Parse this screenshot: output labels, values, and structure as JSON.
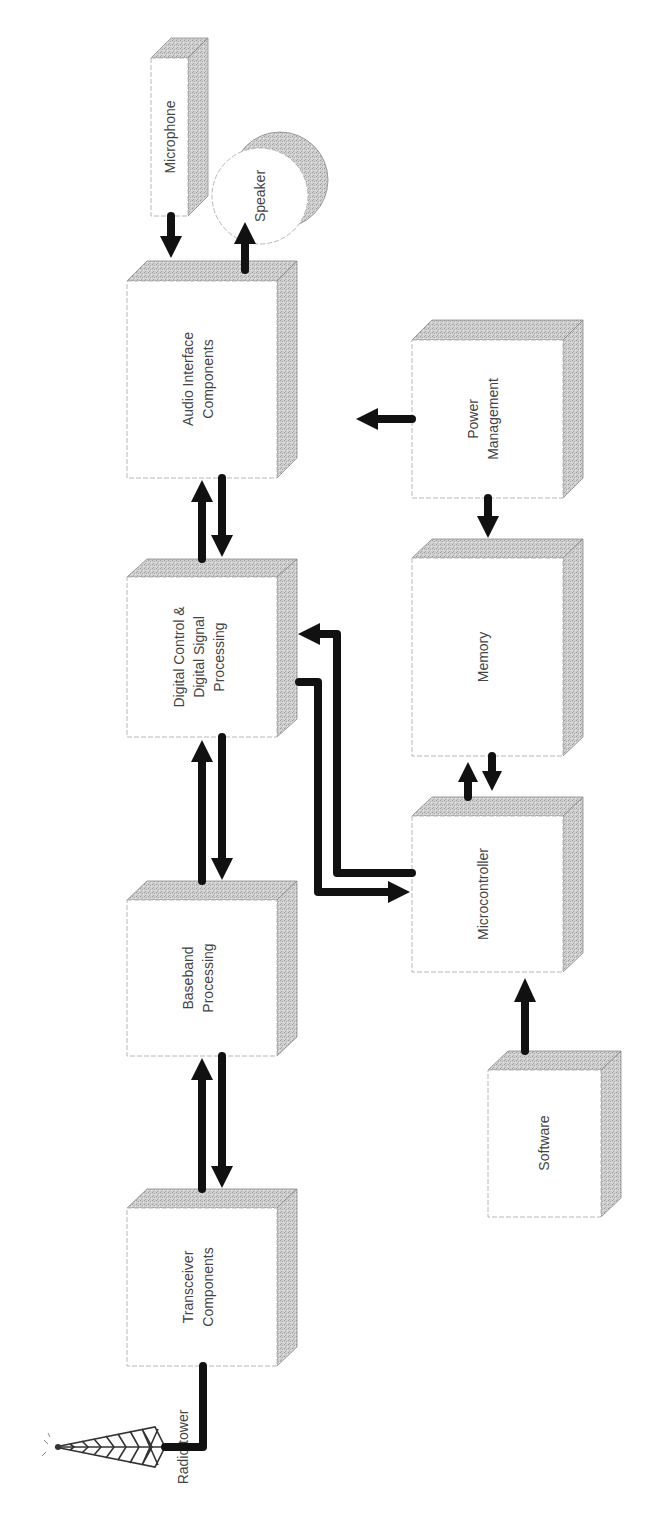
{
  "diagram": {
    "title": "",
    "orientation": "rotated-90-ccw",
    "colors": {
      "block_face": "#ffffff",
      "block_depth": "#c8c8c8",
      "arrow": "#111111",
      "text": "#444444"
    },
    "blocks": {
      "microphone": {
        "label": "Microphone"
      },
      "speaker": {
        "label": "Speaker"
      },
      "audio": {
        "line1": "Audio Interface",
        "line2": "Components"
      },
      "dsp": {
        "line1": "Digital Control &",
        "line2": "Digital Signal",
        "line3": "Processing"
      },
      "baseband": {
        "line1": "Baseband",
        "line2": "Processing"
      },
      "transceiver": {
        "line1": "Transceiver",
        "line2": "Components"
      },
      "power": {
        "line1": "Power",
        "line2": "Management"
      },
      "memory": {
        "label": "Memory"
      },
      "microcontroller": {
        "label": "Microcontroller"
      },
      "software": {
        "label": "Software"
      },
      "tower": {
        "label": "Radio tower"
      }
    },
    "connections": [
      {
        "from": "Microphone",
        "to": "Audio Interface Components",
        "direction": "one-way"
      },
      {
        "from": "Audio Interface Components",
        "to": "Speaker",
        "direction": "one-way"
      },
      {
        "from": "Audio Interface Components",
        "to": "Digital Control & Digital Signal Processing",
        "direction": "bidirectional"
      },
      {
        "from": "Digital Control & Digital Signal Processing",
        "to": "Baseband Processing",
        "direction": "bidirectional"
      },
      {
        "from": "Baseband Processing",
        "to": "Transceiver Components",
        "direction": "bidirectional"
      },
      {
        "from": "Transceiver Components",
        "to": "Radio tower",
        "direction": "line"
      },
      {
        "from": "Digital Control & Digital Signal Processing",
        "to": "Microcontroller",
        "direction": "bidirectional"
      },
      {
        "from": "Microcontroller",
        "to": "Memory",
        "direction": "bidirectional"
      },
      {
        "from": "Power Management",
        "to": "Memory",
        "direction": "one-way"
      },
      {
        "from": "Power Management",
        "to": "Audio column",
        "direction": "one-way"
      },
      {
        "from": "Software",
        "to": "Microcontroller",
        "direction": "one-way"
      }
    ]
  }
}
